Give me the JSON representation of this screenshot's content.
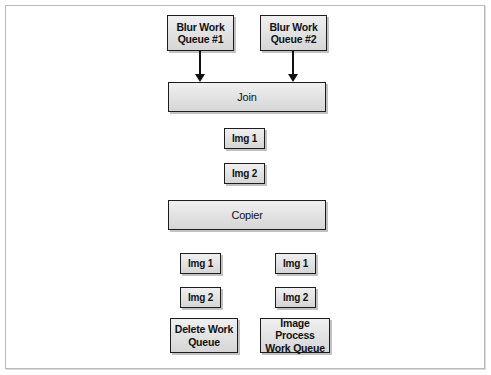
{
  "figure": {
    "background_color": "#ffffff",
    "frame_color": "#b9b9b9",
    "node_fill_color": "#dedede",
    "node_border_color": "#1d1d1d",
    "arrow_color": "#111111"
  },
  "nodes": {
    "blur_queue_1": "Blur Work\nQueue #1",
    "blur_queue_2": "Blur Work\nQueue #2",
    "join": "Join",
    "join_img_1": "Img 1",
    "join_img_2": "Img 2",
    "copier": "Copier",
    "left_img_1": "Img 1",
    "left_img_2": "Img 2",
    "right_img_1": "Img 1",
    "right_img_2": "Img 2",
    "delete_queue": "Delete Work\nQueue",
    "image_process_queue": "Image Process\nWork Queue"
  }
}
